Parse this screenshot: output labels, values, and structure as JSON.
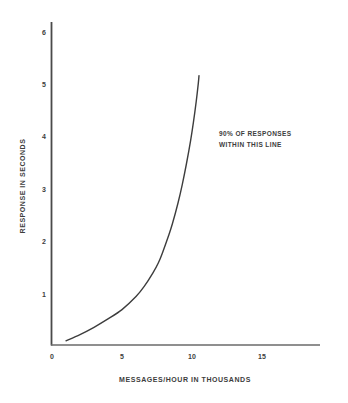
{
  "chart_data": {
    "type": "line",
    "title": "",
    "xlabel": "MESSAGES/HOUR IN THOUSANDS",
    "ylabel": "RESPONSE IN SECONDS",
    "xlim": [
      0,
      19
    ],
    "ylim": [
      0,
      6.4
    ],
    "grid": false,
    "legend": null,
    "xticks": [
      0,
      5,
      10,
      15
    ],
    "xtick_labels": [
      "0",
      "5",
      "10",
      "15"
    ],
    "yticks": [
      1,
      2,
      3,
      4,
      5,
      6
    ],
    "ytick_labels": [
      "1",
      "2",
      "3",
      "4",
      "5",
      "6"
    ],
    "series": [
      {
        "name": "90% response time",
        "color": "#3d3d3d",
        "linewidth": 1.4,
        "x": [
          1.0,
          2.0,
          3.0,
          4.0,
          5.0,
          6.0,
          6.6,
          7.2,
          7.6,
          7.9,
          8.3,
          8.6,
          9.0,
          9.3,
          9.6,
          9.9,
          10.1,
          10.3,
          10.45,
          10.5
        ],
        "y": [
          0.1,
          0.22,
          0.36,
          0.52,
          0.7,
          0.95,
          1.15,
          1.4,
          1.6,
          1.8,
          2.1,
          2.35,
          2.75,
          3.1,
          3.5,
          3.95,
          4.3,
          4.7,
          5.05,
          5.2
        ]
      }
    ],
    "annotations": [
      {
        "name": "curve-annotation",
        "lines": [
          "90% OF RESPONSES",
          "WITHIN THIS LINE"
        ],
        "x": 12.0,
        "y": 4.1
      }
    ],
    "axis_color": "#4a4a4a",
    "text_color": "#3d3d3d",
    "background": "#ffffff"
  },
  "annotation": {
    "line1": "90% OF RESPONSES",
    "line2": "WITHIN THIS LINE"
  }
}
